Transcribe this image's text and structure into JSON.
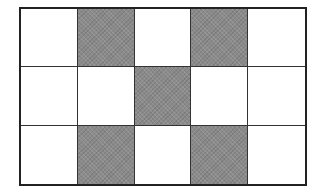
{
  "grid": {
    "rows": 3,
    "cols": 5,
    "shaded_color": "#8a8a8a",
    "empty_color": "#ffffff",
    "line_color": "#222222",
    "cells": [
      [
        0,
        1,
        0,
        1,
        0
      ],
      [
        0,
        0,
        1,
        0,
        0
      ],
      [
        0,
        1,
        0,
        1,
        0
      ]
    ]
  }
}
